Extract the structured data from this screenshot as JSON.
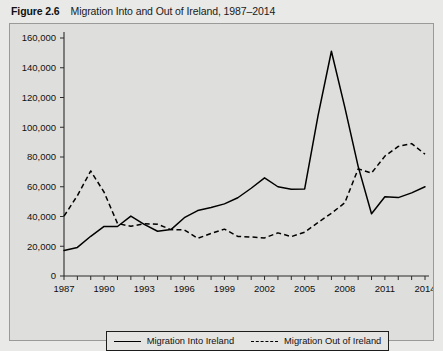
{
  "caption": {
    "figure_number": "Figure 2.6",
    "title": "Migration Into and Out of Ireland, 1987–2014"
  },
  "legend": {
    "entries": [
      {
        "label": "Migration Into Ireland",
        "style": "solid",
        "color": "#000000"
      },
      {
        "label": "Migration Out of Ireland",
        "style": "dashed",
        "color": "#000000"
      }
    ]
  },
  "colors": {
    "page_background": "#e9e9e7",
    "panel_background": "#dededc",
    "panel_border": "#9a9a98",
    "axis": "#2b2b2b",
    "line": "#000000"
  },
  "chart_data": {
    "type": "line",
    "title": "Migration Into and Out of Ireland, 1987–2014",
    "xlabel": "",
    "ylabel": "",
    "xlim": [
      1987,
      2014
    ],
    "ylim": [
      0,
      160000
    ],
    "ytick_values": [
      0,
      20000,
      40000,
      60000,
      80000,
      100000,
      120000,
      140000,
      160000
    ],
    "ytick_labels": [
      "0",
      "20,000",
      "40,000",
      "60,000",
      "80,000",
      "100,000",
      "120,000",
      "140,000",
      "160,000"
    ],
    "xtick_values": [
      1987,
      1988,
      1989,
      1990,
      1991,
      1992,
      1993,
      1994,
      1995,
      1996,
      1997,
      1998,
      1999,
      2000,
      2001,
      2002,
      2003,
      2004,
      2005,
      2006,
      2007,
      2008,
      2009,
      2010,
      2011,
      2012,
      2013,
      2014
    ],
    "xtick_labels_shown": [
      "1987",
      "1990",
      "1993",
      "1996",
      "1999",
      "2002",
      "2005",
      "2008",
      "2011",
      "2014"
    ],
    "xtick_label_interval": 3,
    "grid": false,
    "legend_position": "bottom",
    "x": [
      1987,
      1988,
      1989,
      1990,
      1991,
      1992,
      1993,
      1994,
      1995,
      1996,
      1997,
      1998,
      1999,
      2000,
      2001,
      2002,
      2003,
      2004,
      2005,
      2006,
      2007,
      2008,
      2009,
      2010,
      2011,
      2012,
      2013,
      2014
    ],
    "series": [
      {
        "name": "Migration Into Ireland",
        "style": "solid",
        "values": [
          17200,
          19200,
          26700,
          33300,
          33300,
          40300,
          34700,
          30100,
          31200,
          39200,
          44000,
          46000,
          48500,
          52600,
          59000,
          66000,
          60000,
          58300,
          58500,
          107800,
          151100,
          113500,
          73700,
          41800,
          53300,
          52700,
          55900,
          60000
        ]
      },
      {
        "name": "Migration Out of Ireland",
        "style": "dashed",
        "values": [
          40200,
          54000,
          70600,
          56300,
          35300,
          33400,
          35100,
          34800,
          31200,
          31000,
          25300,
          28600,
          31500,
          26600,
          26200,
          25600,
          29000,
          26500,
          29400,
          36000,
          42200,
          49200,
          72000,
          69200,
          80600,
          87100,
          89000,
          81900
        ]
      }
    ],
    "annotations": []
  }
}
